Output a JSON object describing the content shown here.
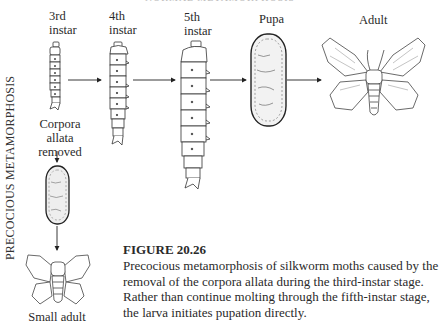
{
  "figure": {
    "header_cut": "NORMAL METAMORPHOSIS",
    "side_label": "PRECOCIOUS METAMORPHOSIS",
    "stages": [
      {
        "line1": "3rd",
        "line2": "instar"
      },
      {
        "line1": "4th",
        "line2": "instar"
      },
      {
        "line1": "5th",
        "line2": "instar"
      },
      {
        "line1": "Pupa",
        "line2": ""
      },
      {
        "line1": "Adult",
        "line2": ""
      }
    ],
    "branch": {
      "treatment_line1": "Corpora",
      "treatment_line2": "allata",
      "treatment_line3": "removed",
      "result_label": "Small adult"
    },
    "icons": [
      "larva-3rd-instar",
      "larva-4th-instar",
      "larva-5th-instar",
      "pupa",
      "adult-moth",
      "small-pupa",
      "small-adult-moth",
      "arrow-right",
      "arrow-down"
    ]
  },
  "caption": {
    "number": "FIGURE 20.26",
    "text": "Precocious metamorphosis of silkworm moths caused by the removal of the corpora allata during the third-instar stage. Rather than continue molting through the fifth-instar stage, the larva initiates pupation directly."
  }
}
